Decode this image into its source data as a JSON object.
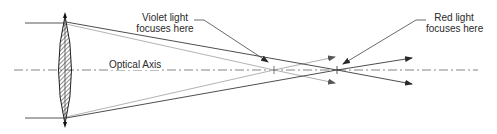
{
  "diagram": {
    "labels": {
      "violet_line1": "Violet light",
      "violet_line2": "focuses here",
      "red_line1": "Red light",
      "red_line2": "focuses here",
      "axis": "Optical Axis"
    },
    "elements": {
      "lens": "biconvex lens (hatched)",
      "axis": "dash-dot optical axis",
      "red_rays": "dark rays converging at red focal point",
      "violet_rays": "light gray rays converging at violet focal point"
    },
    "colors": {
      "background": "#ffffff",
      "red_ray": "#3a3a3a",
      "violet_ray": "#a8a8a8",
      "axis": "#555555",
      "text": "#2a2a2a"
    },
    "geometry": {
      "lens_center_x": 65,
      "axis_y": 70,
      "violet_focus_x": 274,
      "red_focus_x": 337
    }
  }
}
